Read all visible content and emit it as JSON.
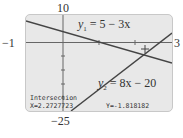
{
  "window_labels": {
    "ymax": "10",
    "ymin": "−25",
    "xmin": "−1",
    "xmax": "3"
  },
  "equations": {
    "y1": {
      "name": "y",
      "sub": "1",
      "rhs": "= 5 − 3x"
    },
    "y2": {
      "name": "y",
      "sub": "2",
      "rhs": "= 8x − 20"
    }
  },
  "readout": {
    "title": "Intersection",
    "x": "X=2.2727723",
    "y": "Y=-1.818182"
  },
  "colors": {
    "screen_bg": "#e8e8e8",
    "line": "#444444",
    "axis": "#666666"
  }
}
